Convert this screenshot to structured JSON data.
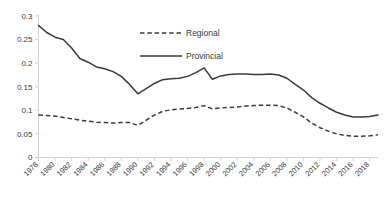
{
  "chart_data": {
    "type": "line",
    "title": "",
    "subtitle": "",
    "xlabel": "",
    "ylabel": "",
    "xlim": [
      1978,
      2019
    ],
    "ylim": [
      0,
      0.3
    ],
    "grid": false,
    "legend_position": "top-center",
    "y_ticks": [
      "0",
      "0.05",
      "0.1",
      "0.15",
      "0.2",
      "0.25",
      "0.3"
    ],
    "y_tick_values": [
      0,
      0.05,
      0.1,
      0.15,
      0.2,
      0.25,
      0.3
    ],
    "x_ticks": [
      "1978",
      "1980",
      "1982",
      "1984",
      "1986",
      "1988",
      "1990",
      "1992",
      "1994",
      "1996",
      "1998",
      "2000",
      "2002",
      "2004",
      "2006",
      "2008",
      "2010",
      "2012",
      "2014",
      "2016",
      "2018"
    ],
    "x_tick_values": [
      1978,
      1980,
      1982,
      1984,
      1986,
      1988,
      1990,
      1992,
      1994,
      1996,
      1998,
      2000,
      2002,
      2004,
      2006,
      2008,
      2010,
      2012,
      2014,
      2016,
      2018
    ],
    "x": [
      1978,
      1979,
      1980,
      1981,
      1982,
      1983,
      1984,
      1985,
      1986,
      1987,
      1988,
      1989,
      1990,
      1991,
      1992,
      1993,
      1994,
      1995,
      1996,
      1997,
      1998,
      1999,
      2000,
      2001,
      2002,
      2003,
      2004,
      2005,
      2006,
      2007,
      2008,
      2009,
      2010,
      2011,
      2012,
      2013,
      2014,
      2015,
      2016,
      2017,
      2018,
      2019
    ],
    "series": [
      {
        "name": "Regional",
        "style": "dashed",
        "color": "#3b3b3b",
        "values": [
          0.09,
          0.089,
          0.088,
          0.085,
          0.082,
          0.079,
          0.077,
          0.075,
          0.074,
          0.073,
          0.074,
          0.074,
          0.068,
          0.079,
          0.09,
          0.098,
          0.101,
          0.103,
          0.104,
          0.106,
          0.11,
          0.103,
          0.105,
          0.106,
          0.107,
          0.109,
          0.11,
          0.111,
          0.111,
          0.11,
          0.105,
          0.096,
          0.086,
          0.073,
          0.063,
          0.056,
          0.05,
          0.047,
          0.045,
          0.045,
          0.046,
          0.048
        ]
      },
      {
        "name": "Provincial",
        "style": "solid",
        "color": "#3b3b3b",
        "values": [
          0.28,
          0.265,
          0.255,
          0.25,
          0.232,
          0.21,
          0.202,
          0.192,
          0.188,
          0.182,
          0.172,
          0.155,
          0.135,
          0.146,
          0.157,
          0.165,
          0.167,
          0.168,
          0.172,
          0.18,
          0.19,
          0.166,
          0.173,
          0.176,
          0.177,
          0.177,
          0.176,
          0.176,
          0.177,
          0.175,
          0.168,
          0.155,
          0.143,
          0.127,
          0.115,
          0.105,
          0.096,
          0.09,
          0.086,
          0.086,
          0.087,
          0.09
        ]
      }
    ],
    "legend": [
      {
        "label": "Regional",
        "style": "dashed"
      },
      {
        "label": "Provincial",
        "style": "solid"
      }
    ]
  }
}
